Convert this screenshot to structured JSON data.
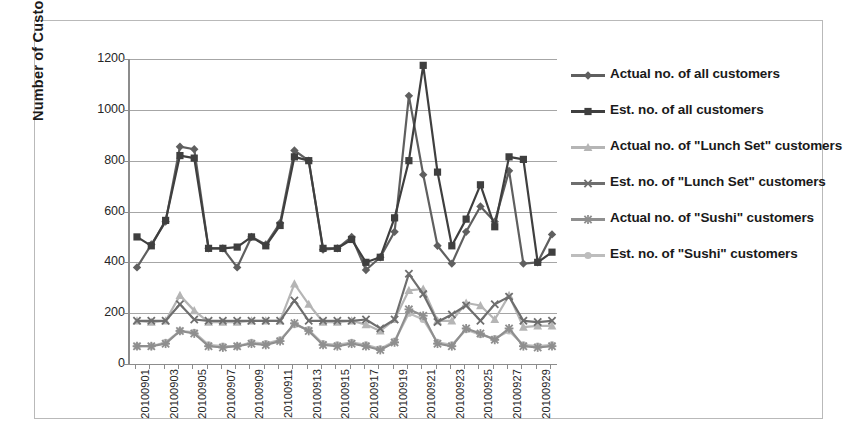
{
  "figure": {
    "y_axis_title": "Number of Customers",
    "background": "#ffffff",
    "frame_color": "#b9b9b9"
  },
  "legend": {
    "position": "right",
    "items": [
      {
        "label": "Actual no. of all customers",
        "color": "#5f5f5f",
        "marker": "diamond",
        "key": "actual_all"
      },
      {
        "label": "Est. no. of all customers",
        "color": "#3f3f3f",
        "marker": "square",
        "key": "est_all"
      },
      {
        "label": "Actual no. of \"Lunch Set\" customers",
        "color": "#b5b5b5",
        "marker": "triangle",
        "key": "actual_lunch"
      },
      {
        "label": "Est. no. of \"Lunch Set\" customers",
        "color": "#6e6e6e",
        "marker": "x",
        "key": "est_lunch"
      },
      {
        "label": "Actual no. of \"Sushi\" customers",
        "color": "#8f8f8f",
        "marker": "star",
        "key": "actual_sushi"
      },
      {
        "label": "Est. no. of \"Sushi\" customers",
        "color": "#bdbdbd",
        "marker": "circle",
        "key": "est_sushi"
      }
    ]
  },
  "chart_data": {
    "type": "line",
    "title": "",
    "xlabel": "",
    "ylabel": "Number of Customers",
    "ylim": [
      0,
      1200
    ],
    "yticks": [
      0,
      200,
      400,
      600,
      800,
      1000,
      1200
    ],
    "grid": true,
    "legend_position": "right",
    "x": [
      "20100901",
      "20100902",
      "20100903",
      "20100904",
      "20100905",
      "20100906",
      "20100907",
      "20100908",
      "20100909",
      "20100910",
      "20100911",
      "20100912",
      "20100913",
      "20100914",
      "20100915",
      "20100916",
      "20100917",
      "20100918",
      "20100919",
      "20100920",
      "20100921",
      "20100922",
      "20100923",
      "20100924",
      "20100925",
      "20100926",
      "20100927",
      "20100928",
      "20100929",
      "20100930"
    ],
    "xtick_labels": [
      "20100901",
      "20100903",
      "20100905",
      "20100907",
      "20100909",
      "20100911",
      "20100913",
      "20100915",
      "20100917",
      "20100919",
      "20100921",
      "20100923",
      "20100925",
      "20100927",
      "20100929"
    ],
    "series": [
      {
        "name": "Actual no. of all customers",
        "marker": "diamond",
        "color": "#5f5f5f",
        "values": [
          380,
          470,
          560,
          855,
          845,
          455,
          455,
          380,
          500,
          470,
          555,
          840,
          800,
          450,
          455,
          500,
          370,
          420,
          520,
          1055,
          745,
          465,
          395,
          520,
          620,
          560,
          760,
          395,
          400,
          510
        ]
      },
      {
        "name": "Est. no. of all customers",
        "marker": "square",
        "color": "#3f3f3f",
        "values": [
          500,
          465,
          565,
          820,
          810,
          455,
          455,
          460,
          500,
          465,
          545,
          815,
          800,
          455,
          455,
          490,
          400,
          420,
          575,
          800,
          1175,
          755,
          465,
          570,
          705,
          540,
          815,
          805,
          400,
          440
        ]
      },
      {
        "name": "Actual no. of \"Lunch Set\" customers",
        "marker": "triangle",
        "color": "#b5b5b5",
        "values": [
          170,
          165,
          170,
          270,
          210,
          165,
          165,
          165,
          170,
          170,
          170,
          315,
          235,
          165,
          165,
          170,
          155,
          130,
          175,
          290,
          295,
          170,
          170,
          240,
          230,
          175,
          270,
          145,
          150,
          150
        ]
      },
      {
        "name": "Est. no. of \"Lunch Set\" customers",
        "marker": "x",
        "color": "#6e6e6e",
        "values": [
          170,
          170,
          170,
          235,
          175,
          170,
          170,
          170,
          170,
          170,
          170,
          250,
          170,
          170,
          170,
          170,
          175,
          140,
          175,
          355,
          275,
          165,
          195,
          230,
          170,
          235,
          265,
          170,
          165,
          170
        ]
      },
      {
        "name": "Actual no. of \"Sushi\" customers",
        "marker": "star",
        "color": "#8f8f8f",
        "values": [
          70,
          70,
          80,
          130,
          120,
          70,
          65,
          70,
          80,
          75,
          90,
          160,
          130,
          75,
          70,
          80,
          70,
          55,
          85,
          215,
          190,
          80,
          70,
          140,
          120,
          95,
          140,
          70,
          65,
          70
        ]
      },
      {
        "name": "Est. no. of \"Sushi\" customers",
        "marker": "circle",
        "color": "#bdbdbd",
        "values": [
          70,
          70,
          85,
          130,
          125,
          75,
          70,
          70,
          85,
          80,
          95,
          155,
          135,
          80,
          75,
          85,
          75,
          60,
          90,
          200,
          175,
          85,
          75,
          135,
          115,
          100,
          130,
          75,
          70,
          75
        ]
      }
    ]
  }
}
